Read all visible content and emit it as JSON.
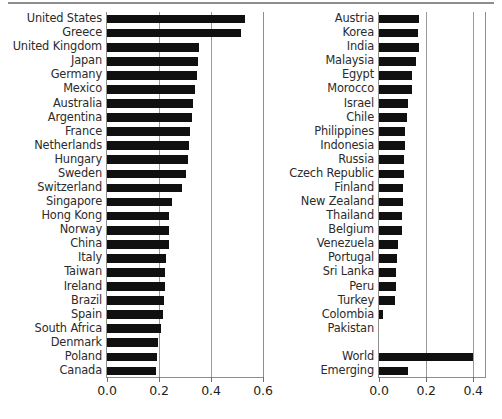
{
  "figure": {
    "caption_partial": "",
    "bar_color": "#101010",
    "axis_color": "#8f8f8f",
    "grid_color": "#9a9a9a"
  },
  "chart_data": [
    {
      "type": "bar",
      "orientation": "horizontal",
      "panel": "left",
      "title": "",
      "xlabel": "",
      "ylabel": "",
      "xlim": [
        0.0,
        0.6
      ],
      "ticks": [
        "0.0",
        "0.2",
        "0.4",
        "0.6"
      ],
      "tickvalues": [
        0.0,
        0.2,
        0.4,
        0.6
      ],
      "grid": true,
      "legend": "none",
      "categories": [
        "United States",
        "Greece",
        "United Kingdom",
        "Japan",
        "Germany",
        "Mexico",
        "Australia",
        "Argentina",
        "France",
        "Netherlands",
        "Hungary",
        "Sweden",
        "Switzerland",
        "Singapore",
        "Hong Kong",
        "Norway",
        "China",
        "Italy",
        "Taiwan",
        "Ireland",
        "Brazil",
        "Spain",
        "South Africa",
        "Denmark",
        "Poland",
        "Canada"
      ],
      "values": [
        0.53,
        0.515,
        0.355,
        0.35,
        0.345,
        0.34,
        0.33,
        0.325,
        0.32,
        0.315,
        0.31,
        0.305,
        0.29,
        0.25,
        0.24,
        0.238,
        0.237,
        0.228,
        0.224,
        0.222,
        0.218,
        0.215,
        0.208,
        0.196,
        0.194,
        0.19
      ]
    },
    {
      "type": "bar",
      "orientation": "horizontal",
      "panel": "right",
      "title": "",
      "xlabel": "",
      "ylabel": "",
      "xlim": [
        0.0,
        0.45
      ],
      "ticks": [
        "0.0",
        "0.2",
        "0.4"
      ],
      "tickvalues": [
        0.0,
        0.2,
        0.4
      ],
      "grid": true,
      "legend": "none",
      "categories": [
        "Austria",
        "Korea",
        "India",
        "Malaysia",
        "Egypt",
        "Morocco",
        "Israel",
        "Chile",
        "Philippines",
        "Indonesia",
        "Russia",
        "Czech Republic",
        "Finland",
        "New Zealand",
        "Thailand",
        "Belgium",
        "Venezuela",
        "Portugal",
        "Sri Lanka",
        "Peru",
        "Turkey",
        "Colombia",
        "Pakistan"
      ],
      "values": [
        0.168,
        0.166,
        0.17,
        0.156,
        0.142,
        0.14,
        0.124,
        0.12,
        0.112,
        0.11,
        0.108,
        0.108,
        0.104,
        0.102,
        0.098,
        0.096,
        0.082,
        0.076,
        0.074,
        0.072,
        0.07,
        0.018,
        0.0
      ],
      "aggregate_categories": [
        "World",
        "Emerging"
      ],
      "aggregate_values": [
        0.4,
        0.122
      ]
    }
  ]
}
